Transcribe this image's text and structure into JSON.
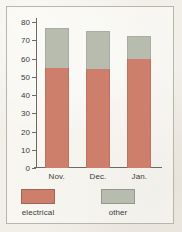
{
  "chart_data": {
    "type": "bar",
    "subtype": "stacked-bar",
    "title": "",
    "xlabel": "",
    "ylabel": "",
    "categories": [
      "Nov.",
      "Dec.",
      "Jan."
    ],
    "series": [
      {
        "name": "electrical",
        "color": "#cd7f6b",
        "values": [
          55,
          54.5,
          60
        ]
      },
      {
        "name": "other",
        "color": "#b7bcae",
        "values": [
          21.5,
          20.5,
          12.5
        ]
      }
    ],
    "totals": [
      76.5,
      75,
      72.5
    ],
    "ylim": [
      0,
      80
    ],
    "ytick_values": [
      0,
      10,
      20,
      30,
      40,
      50,
      60,
      70,
      80
    ],
    "ytick_labels": [
      "0",
      "10",
      "20",
      "30",
      "40",
      "50",
      "60",
      "70",
      "80"
    ],
    "grid": false,
    "legend_position": "bottom"
  },
  "legend": {
    "items": [
      {
        "label": "electrical",
        "color": "#cd7f6b",
        "swatch_name": "legend-swatch-electrical"
      },
      {
        "label": "other",
        "color": "#b7bcae",
        "swatch_name": "legend-swatch-other"
      }
    ]
  },
  "colors": {
    "background": "#f2efe9",
    "frame": "#b9b5ab",
    "axis": "#6d6a64",
    "text": "#3c3a36",
    "electrical": "#cd7f6b",
    "other": "#b7bcae"
  }
}
